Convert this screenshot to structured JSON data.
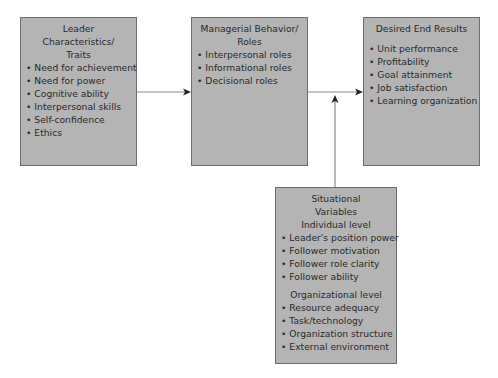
{
  "diagram": {
    "boxes": {
      "leader": {
        "title_line1": "Leader Characteristics/",
        "title_line2": "Traits",
        "items": [
          "Need for achievement",
          "Need for power",
          "Cognitive ability",
          "Interpersonal skills",
          "Self-confidence",
          "Ethics"
        ]
      },
      "managerial": {
        "title_line1": "Managerial Behavior/",
        "title_line2": "Roles",
        "items": [
          "Interpersonal roles",
          "Informational roles",
          "Decisional roles"
        ]
      },
      "results": {
        "title": "Desired End Results",
        "items": [
          "Unit performance",
          "Profitability",
          "Goal attainment",
          "Job satisfaction",
          "Learning organization"
        ]
      },
      "situational": {
        "title_line1": "Situational",
        "title_line2": "Variables",
        "individual_heading": "Individual level",
        "individual_items": [
          "Leader's position power",
          "Follower motivation",
          "Follower role clarity",
          "Follower ability"
        ],
        "organizational_heading": "Organizational level",
        "organizational_items": [
          "Resource adequacy",
          "Task/technology",
          "Organization structure",
          "External environment"
        ]
      }
    },
    "connections": [
      {
        "from": "leader",
        "to": "managerial"
      },
      {
        "from": "managerial",
        "to": "results"
      },
      {
        "from": "situational",
        "to": "managerial-results-link"
      }
    ],
    "colors": {
      "box_fill": "#b4b4b4",
      "box_border": "#6e6e6e",
      "line": "#888888",
      "arrowhead": "#222222"
    }
  }
}
